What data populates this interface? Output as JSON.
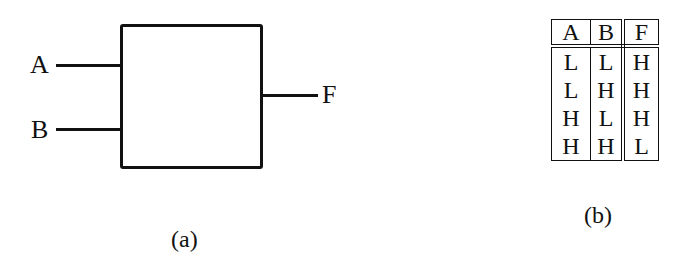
{
  "diagram_a": {
    "caption": "(a)",
    "inputs": [
      {
        "label": "A"
      },
      {
        "label": "B"
      }
    ],
    "output": {
      "label": "F"
    },
    "block": "black-box logic gate"
  },
  "diagram_b": {
    "caption": "(b)",
    "truth_table": {
      "headers": [
        "A",
        "B",
        "F"
      ],
      "rows": [
        [
          "L",
          "L",
          "H"
        ],
        [
          "L",
          "H",
          "H"
        ],
        [
          "H",
          "L",
          "H"
        ],
        [
          "H",
          "H",
          "L"
        ]
      ]
    }
  },
  "colors": {
    "stroke": "#111111",
    "background": "#ffffff"
  }
}
